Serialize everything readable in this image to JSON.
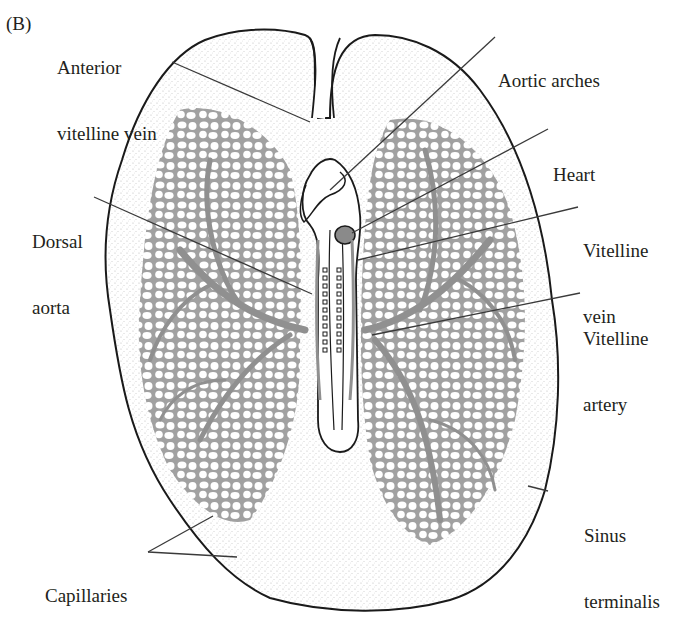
{
  "figure": {
    "panel_label": "(B)",
    "colors": {
      "outline": "#1a1a1a",
      "vessels": "#9a9a9a",
      "stipple": "#b5b5b5",
      "leader_lines": "#3a3a3a",
      "text": "#231f20",
      "background": "#ffffff"
    }
  },
  "labels": {
    "anterior_vitelline_vein": {
      "line1": "Anterior",
      "line2": "vitelline vein"
    },
    "aortic_arches": {
      "line1": "Aortic arches"
    },
    "heart": {
      "line1": "Heart"
    },
    "dorsal_aorta": {
      "line1": "Dorsal",
      "line2": "aorta"
    },
    "vitelline_vein": {
      "line1": "Vitelline",
      "line2": "vein"
    },
    "vitelline_artery": {
      "line1": "Vitelline",
      "line2": "artery"
    },
    "sinus_terminalis": {
      "line1": "Sinus",
      "line2": "terminalis"
    },
    "capillaries": {
      "line1": "Capillaries"
    }
  }
}
